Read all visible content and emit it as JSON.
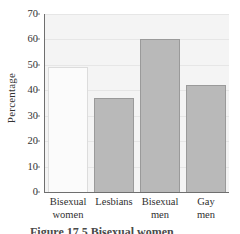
{
  "chart_data": {
    "type": "bar",
    "title": "",
    "xlabel": "",
    "ylabel": "Percentage",
    "ylim": [
      0,
      70
    ],
    "yticks": [
      0,
      10,
      20,
      30,
      40,
      50,
      60,
      70
    ],
    "grid": true,
    "legend": "none",
    "categories": [
      "Bisexual women",
      "Lesbians",
      "Bisexual men",
      "Gay men"
    ],
    "category_lines": [
      [
        "Bisexual",
        "women"
      ],
      [
        "Lesbians",
        ""
      ],
      [
        "Bisexual",
        "men"
      ],
      [
        "Gay",
        "men"
      ]
    ],
    "values": [
      49,
      37,
      60,
      42
    ],
    "bar_colors": [
      "#fbfbfb",
      "#b9b9b9",
      "#b9b9b9",
      "#b9b9b9"
    ],
    "bar_styles": [
      "light",
      "dark",
      "dark",
      "dark"
    ]
  },
  "axis": {
    "y_title": "Percentage",
    "tick_labels": [
      "70",
      "60",
      "50",
      "40",
      "30",
      "20",
      "10",
      "0"
    ]
  },
  "caption": {
    "text": "Figure 17.5  Bisexual women"
  },
  "colors": {
    "plot_background": "#f4f4f4",
    "gridline": "#e6e6e6",
    "axis": "#6f6f6f",
    "bar_light": "#fbfbfb",
    "bar_dark": "#b9b9b9",
    "text": "#333333"
  }
}
